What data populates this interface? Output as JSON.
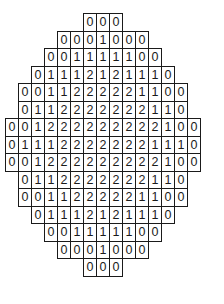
{
  "figure": {
    "type": "diamond-number-grid",
    "grid_width": 15,
    "rows": [
      {
        "offset": 6,
        "values": [
          "0",
          "0",
          "0"
        ]
      },
      {
        "offset": 4,
        "values": [
          "0",
          "0",
          "0",
          "1",
          "0",
          "0",
          "0"
        ]
      },
      {
        "offset": 3,
        "values": [
          "0",
          "0",
          "1",
          "1",
          "1",
          "1",
          "1",
          "0",
          "0"
        ]
      },
      {
        "offset": 2,
        "values": [
          "0",
          "1",
          "1",
          "1",
          "2",
          "1",
          "2",
          "1",
          "1",
          "1",
          "0"
        ]
      },
      {
        "offset": 1,
        "values": [
          "0",
          "0",
          "1",
          "1",
          "2",
          "2",
          "2",
          "2",
          "2",
          "1",
          "1",
          "0",
          "0"
        ]
      },
      {
        "offset": 1,
        "values": [
          "0",
          "1",
          "1",
          "2",
          "2",
          "2",
          "2",
          "2",
          "2",
          "2",
          "1",
          "1",
          "0"
        ]
      },
      {
        "offset": 0,
        "values": [
          "0",
          "0",
          "1",
          "2",
          "2",
          "2",
          "2",
          "2",
          "2",
          "2",
          "2",
          "2",
          "1",
          "0",
          "0"
        ]
      },
      {
        "offset": 0,
        "values": [
          "0",
          "1",
          "1",
          "1",
          "2",
          "2",
          "2",
          "2",
          "2",
          "2",
          "2",
          "1",
          "1",
          "1",
          "0"
        ]
      },
      {
        "offset": 0,
        "values": [
          "0",
          "0",
          "1",
          "2",
          "2",
          "2",
          "2",
          "2",
          "2",
          "2",
          "2",
          "2",
          "1",
          "0",
          "0"
        ]
      },
      {
        "offset": 1,
        "values": [
          "0",
          "1",
          "1",
          "2",
          "2",
          "2",
          "2",
          "2",
          "2",
          "2",
          "1",
          "1",
          "0"
        ]
      },
      {
        "offset": 1,
        "values": [
          "0",
          "0",
          "1",
          "1",
          "2",
          "2",
          "2",
          "2",
          "2",
          "1",
          "1",
          "0",
          "0"
        ]
      },
      {
        "offset": 2,
        "values": [
          "0",
          "1",
          "1",
          "1",
          "2",
          "1",
          "2",
          "1",
          "1",
          "1",
          "0"
        ]
      },
      {
        "offset": 3,
        "values": [
          "0",
          "0",
          "1",
          "1",
          "1",
          "1",
          "1",
          "0",
          "0"
        ]
      },
      {
        "offset": 4,
        "values": [
          "0",
          "0",
          "0",
          "1",
          "0",
          "0",
          "0"
        ]
      },
      {
        "offset": 6,
        "values": [
          "0",
          "0",
          "0"
        ]
      }
    ]
  }
}
